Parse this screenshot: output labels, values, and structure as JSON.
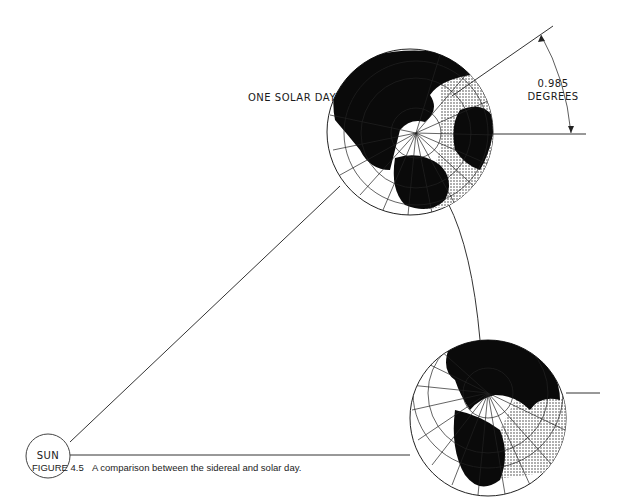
{
  "figure": {
    "caption_prefix": "FIGURE 4.5",
    "caption_text": "A comparison between the sidereal and solar day.",
    "labels": {
      "one_solar_day": "ONE SOLAR DAY",
      "angle_value": "0.985",
      "angle_unit": "DEGREES",
      "sun": "SUN"
    },
    "colors": {
      "line": "#333333",
      "land": "#0a0a0a",
      "background": "#ffffff"
    },
    "elements": {
      "sun": {
        "cx": 48,
        "cy": 456,
        "r": 22
      },
      "earth_solar_day": {
        "cx": 410,
        "cy": 132,
        "r": 83
      },
      "earth_start": {
        "cx": 488,
        "cy": 418,
        "r": 78
      }
    }
  }
}
